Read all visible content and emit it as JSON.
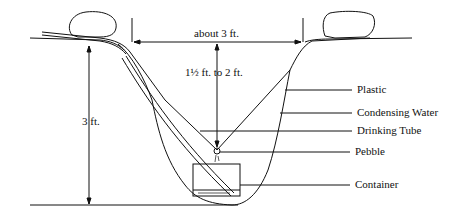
{
  "diagram": {
    "dimensions": {
      "width_label": "about 3 ft.",
      "cone_depth_label": "1½ ft. to 2 ft.",
      "pit_depth_label": "3 ft."
    },
    "callouts": [
      {
        "label": "Plastic"
      },
      {
        "label": "Condensing Water"
      },
      {
        "label": "Drinking Tube"
      },
      {
        "label": "Pebble"
      },
      {
        "label": "Container"
      }
    ],
    "colors": {
      "line": "#111111",
      "background": "#ffffff"
    }
  }
}
